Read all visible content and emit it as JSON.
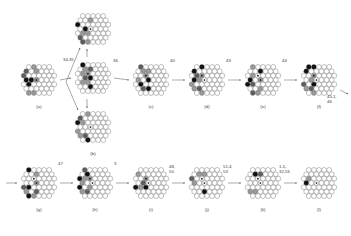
{
  "figure": {
    "type": "reaction-scheme",
    "rows": 2
  },
  "colors": {
    "white_site": "#ffffff",
    "gray_site": "#9a9a9a",
    "dark_site": "#5e5e5e",
    "black_site": "#101010",
    "outline": "#4a4a4a",
    "arrow": "#555555",
    "text": "#3a3a3a"
  },
  "legend_sites": {
    "white": "unsubstituted vertex",
    "gray": "first substituent type",
    "dark": "second substituent type",
    "black": "third substituent type",
    "dot": "center marker"
  },
  "structures": [
    {
      "id": "a",
      "label": "(a)",
      "row": 1,
      "x": 14,
      "y": 57,
      "w": 50,
      "h": 46,
      "pattern": "hex-cluster",
      "sites": {
        "gray": 5,
        "black": 3,
        "dark": 2,
        "dots": 1
      }
    },
    {
      "id": "b",
      "label": "(b)",
      "row": 1,
      "x": 68,
      "y": 104,
      "w": 50,
      "h": 46,
      "pattern": "hex-cluster",
      "sites": {
        "gray": 4,
        "black": 2,
        "dark": 2,
        "dots": 1
      }
    },
    {
      "id": "b_top",
      "label": "",
      "row": 1,
      "x": 68,
      "y": 6,
      "w": 50,
      "h": 46,
      "pattern": "hex-cluster",
      "sites": {
        "gray": 4,
        "black": 2,
        "dark": 2,
        "dots": 1
      }
    },
    {
      "id": "center",
      "label": "",
      "row": 1,
      "x": 68,
      "y": 55,
      "w": 50,
      "h": 46,
      "pattern": "hex-cluster",
      "sites": {
        "gray": 5,
        "black": 3,
        "dark": 2,
        "dots": 2
      }
    },
    {
      "id": "c",
      "label": "(c)",
      "row": 1,
      "x": 126,
      "y": 57,
      "w": 50,
      "h": 46,
      "pattern": "hex-cluster",
      "sites": {
        "gray": 4,
        "black": 3,
        "dark": 2,
        "dots": 2
      }
    },
    {
      "id": "d",
      "label": "(d)",
      "row": 1,
      "x": 182,
      "y": 57,
      "w": 50,
      "h": 46,
      "pattern": "hex-cluster",
      "sites": {
        "gray": 5,
        "black": 3,
        "dark": 2,
        "dots": 2
      }
    },
    {
      "id": "e",
      "label": "(e)",
      "row": 1,
      "x": 238,
      "y": 57,
      "w": 50,
      "h": 46,
      "pattern": "hex-cluster",
      "sites": {
        "gray": 5,
        "black": 3,
        "dark": 2,
        "dots": 2
      }
    },
    {
      "id": "f",
      "label": "(f)",
      "row": 1,
      "x": 294,
      "y": 57,
      "w": 50,
      "h": 46,
      "pattern": "hex-cluster",
      "sites": {
        "gray": 4,
        "black": 4,
        "dark": 2,
        "dots": 2
      }
    },
    {
      "id": "g",
      "label": "(g)",
      "row": 2,
      "x": 14,
      "y": 160,
      "w": 50,
      "h": 46,
      "pattern": "hex-cluster",
      "sites": {
        "gray": 4,
        "black": 3,
        "dark": 2,
        "dots": 2
      }
    },
    {
      "id": "h",
      "label": "(h)",
      "row": 2,
      "x": 70,
      "y": 160,
      "w": 50,
      "h": 46,
      "pattern": "hex-cluster",
      "sites": {
        "gray": 5,
        "black": 3,
        "dark": 2,
        "dots": 2
      }
    },
    {
      "id": "i",
      "label": "(i)",
      "row": 2,
      "x": 126,
      "y": 160,
      "w": 50,
      "h": 46,
      "pattern": "hex-cluster",
      "sites": {
        "gray": 3,
        "black": 2,
        "dark": 1,
        "dots": 2
      }
    },
    {
      "id": "j",
      "label": "(j)",
      "row": 2,
      "x": 182,
      "y": 160,
      "w": 50,
      "h": 46,
      "pattern": "hex-cluster",
      "sites": {
        "gray": 3,
        "black": 1,
        "dark": 1,
        "dots": 2
      }
    },
    {
      "id": "k",
      "label": "(k)",
      "row": 2,
      "x": 238,
      "y": 160,
      "w": 50,
      "h": 46,
      "pattern": "hex-cluster",
      "sites": {
        "gray": 2,
        "black": 1,
        "dark": 1,
        "dots": 2
      }
    },
    {
      "id": "l",
      "label": "(l)",
      "row": 2,
      "x": 294,
      "y": 160,
      "w": 50,
      "h": 46,
      "pattern": "hex-cluster",
      "sites": {
        "gray": 1,
        "black": 1,
        "dark": 0,
        "dots": 1
      }
    }
  ],
  "arrow_labels": [
    {
      "id": "lbl-3435",
      "text": "34,35",
      "x": 63,
      "y": 58
    },
    {
      "id": "lbl-36",
      "text": "36",
      "x": 113,
      "y": 59
    },
    {
      "id": "lbl-40",
      "text": "40",
      "x": 170,
      "y": 59
    },
    {
      "id": "lbl-43",
      "text": "43",
      "x": 226,
      "y": 59
    },
    {
      "id": "lbl-44",
      "text": "44",
      "x": 282,
      "y": 59
    },
    {
      "id": "lbl-4546",
      "text": "45,1,\n46",
      "x": 327,
      "y": 95
    },
    {
      "id": "lbl-47",
      "text": "47",
      "x": 58,
      "y": 162
    },
    {
      "id": "lbl-3b",
      "text": "3",
      "x": 114,
      "y": 162
    },
    {
      "id": "lbl-4850",
      "text": "48,\n50",
      "x": 169,
      "y": 165
    },
    {
      "id": "lbl-5153",
      "text": "51,4,\n53",
      "x": 223,
      "y": 165
    },
    {
      "id": "lbl-13253",
      "text": "1-5,\n32,53",
      "x": 279,
      "y": 165
    }
  ]
}
